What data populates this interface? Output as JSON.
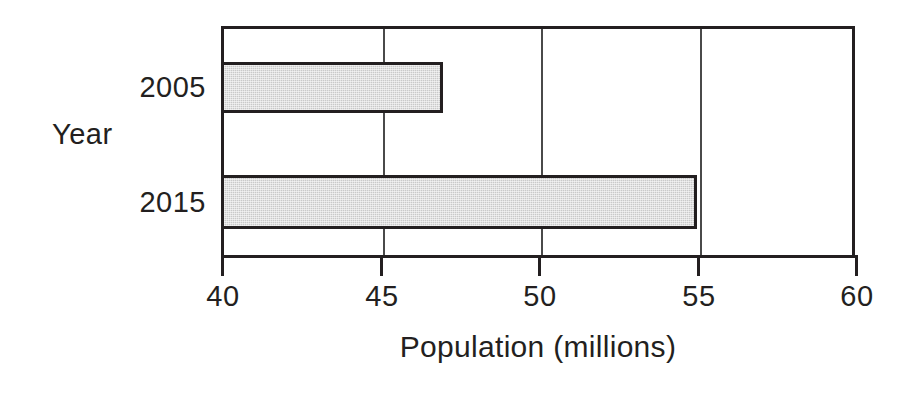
{
  "chart_data": {
    "type": "bar",
    "orientation": "horizontal",
    "title": "",
    "xlabel": "Population (millions)",
    "ylabel": "Year",
    "categories": [
      "2005",
      "2015"
    ],
    "values": [
      47,
      55
    ],
    "series": [
      {
        "name": "Population",
        "values": [
          47,
          55
        ]
      }
    ],
    "xlim": [
      40,
      60
    ],
    "xticks": [
      40,
      45,
      50,
      55,
      60
    ],
    "xtick_labels": [
      "40",
      "45",
      "50",
      "55",
      "60"
    ],
    "grid": "vertical",
    "gridlines_at": [
      45,
      50,
      55
    ],
    "legend": null,
    "bar_fill_color": "#c9c9c9",
    "bar_edge_color": "#231f20",
    "axis_color": "#231f20",
    "background_color": "#ffffff"
  },
  "bars": [
    {
      "category": "2005",
      "value": 47
    },
    {
      "category": "2015",
      "value": 55
    }
  ]
}
